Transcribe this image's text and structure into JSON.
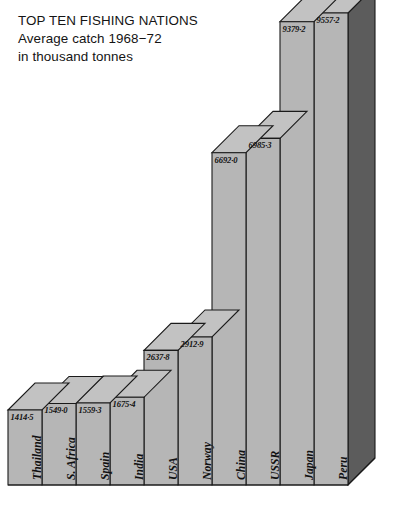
{
  "title": {
    "line1": "TOP TEN FISHING NATIONS",
    "line2": "Average catch 1968−72",
    "line3": "in thousand tonnes"
  },
  "colors": {
    "background": "#ffffff",
    "bar_front": "#b6b6b6",
    "bar_top": "#c2c2c2",
    "bar_side_dark": "#5c5c5c",
    "outline": "#1a1a1a",
    "text": "#141414"
  },
  "chart_data": {
    "type": "bar",
    "title": "TOP TEN FISHING NATIONS",
    "subtitle": "Average catch 1968−72 in thousand tonnes",
    "xlabel": "",
    "ylabel": "thousand tonnes",
    "ylim": [
      0,
      9557.2
    ],
    "grid": false,
    "legend": "none",
    "orientation": "vertical",
    "style": "isometric-3d",
    "sorted": "ascending",
    "unit": "thousand tonnes",
    "period": "1968–72",
    "categories": [
      "Thailand",
      "S. Africa",
      "Spain",
      "India",
      "USA",
      "Norway",
      "China",
      "USSR",
      "Japan",
      "Peru"
    ],
    "values": [
      1414.5,
      1549.0,
      1559.3,
      1675.4,
      2637.8,
      2912.9,
      6692.0,
      6985.3,
      9379.2,
      9557.2
    ],
    "value_labels": [
      "1414·5",
      "1549·0",
      "1559·3",
      "1675·4",
      "2637·8",
      "2912·9",
      "6692·0",
      "6985·3",
      "9379·2",
      "9557·2"
    ],
    "bars": [
      {
        "name": "Thailand",
        "value": 1414.5,
        "label": "1414·5"
      },
      {
        "name": "S. Africa",
        "value": 1549.0,
        "label": "1549·0"
      },
      {
        "name": "Spain",
        "value": 1559.3,
        "label": "1559·3"
      },
      {
        "name": "India",
        "value": 1675.4,
        "label": "1675·4"
      },
      {
        "name": "USA",
        "value": 2637.8,
        "label": "2637·8"
      },
      {
        "name": "Norway",
        "value": 2912.9,
        "label": "2912·9"
      },
      {
        "name": "China",
        "value": 6692.0,
        "label": "6692·0"
      },
      {
        "name": "USSR",
        "value": 6985.3,
        "label": "6985·3"
      },
      {
        "name": "Japan",
        "value": 9379.2,
        "label": "9379·2"
      },
      {
        "name": "Peru",
        "value": 9557.2,
        "label": "9557·2"
      }
    ]
  }
}
